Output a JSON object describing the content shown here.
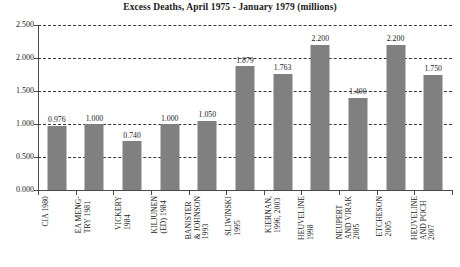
{
  "chart_data": {
    "type": "bar",
    "title": "Excess Deaths, April 1975 - January 1979 (millions)",
    "xlabel": "",
    "ylabel": "",
    "ylim": [
      0.0,
      2.5
    ],
    "ytick_step": 0.5,
    "ytick_labels": [
      "0.000",
      "0.500",
      "1.000",
      "1.500",
      "2.000",
      "2.500"
    ],
    "ytick_values": [
      0.0,
      0.5,
      1.0,
      1.5,
      2.0,
      2.5
    ],
    "grid": true,
    "grid_style": "dashed-horizontal",
    "legend": "none",
    "bar_color": "#808080",
    "categories": [
      "CIA 1980",
      "EA MENG-TRY 1981",
      "VICKERY 1984",
      "KILJUNEN (ED) 1984",
      "BANISTER & JOHNSON 1993",
      "SLIWINSKI 1995",
      "KIERNAN, 1996, 2003",
      "HEUVELINE 1998",
      "NEUPERT AND VIRAK 2005",
      "ETCHESON 2005",
      "HEUVELINE AND POCH 2007"
    ],
    "category_lines": [
      [
        "CIA 1980"
      ],
      [
        "EA MENG-",
        "TRY 1981"
      ],
      [
        "VICKERY",
        "1984"
      ],
      [
        "KILJUNEN",
        "(ED) 1984"
      ],
      [
        "BANISTER",
        "& JOHNSON",
        "1993"
      ],
      [
        "SLIWINSKI",
        "1995"
      ],
      [
        "KIERNAN,",
        "1996, 2003"
      ],
      [
        "HEUVELINE",
        "1998"
      ],
      [
        "NEUPERT",
        "AND VIRAK",
        "2005"
      ],
      [
        "ETCHESON",
        "2005"
      ],
      [
        "HEUVELINE",
        "AND POCH",
        "2007"
      ]
    ],
    "values": [
      0.976,
      1.0,
      0.74,
      1.0,
      1.05,
      1.879,
      1.763,
      2.2,
      1.4,
      2.2,
      1.75
    ],
    "value_labels": [
      "0.976",
      "1.000",
      "0.740",
      "1.000",
      "1.050",
      "1.879",
      "1.763",
      "2.200",
      "1.400",
      "2.200",
      "1.750"
    ]
  }
}
